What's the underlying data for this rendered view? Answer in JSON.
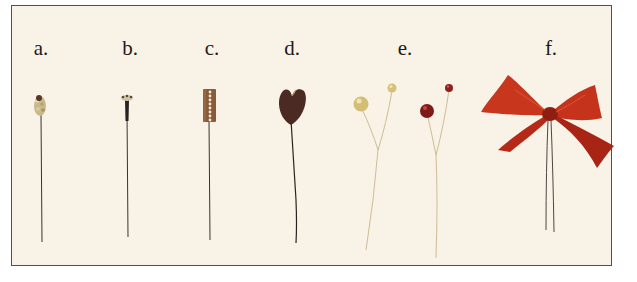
{
  "image": {
    "description": "Photo of six floral wire picks on a cream card, labeled a through f",
    "card_color": "#f8f2e7",
    "border_color": "#7a3f3a"
  },
  "labels": [
    {
      "id": "a",
      "text": "a.",
      "x": 41
    },
    {
      "id": "b",
      "text": "b.",
      "x": 130
    },
    {
      "id": "c",
      "text": "c.",
      "x": 212
    },
    {
      "id": "d",
      "text": "d.",
      "x": 292
    },
    {
      "id": "e",
      "text": "e.",
      "x": 405
    },
    {
      "id": "f",
      "text": "f.",
      "x": 551
    }
  ],
  "items": [
    {
      "id": "a",
      "name": "beaded-cluster-pick",
      "colors": [
        "#c9b88a",
        "#5a3a2a"
      ]
    },
    {
      "id": "b",
      "name": "dark-stamen-pick",
      "colors": [
        "#2a2220",
        "#cfc4a8"
      ]
    },
    {
      "id": "c",
      "name": "rectangular-bead-with-pearls-pick",
      "colors": [
        "#8a5a3a",
        "#efe6d0"
      ]
    },
    {
      "id": "d",
      "name": "heart-shaped-seed-pick",
      "colors": [
        "#4a2a22"
      ]
    },
    {
      "id": "e",
      "name": "gold-and-red-pearl-picks",
      "colors": [
        "#d8c27a",
        "#8a1c1c"
      ]
    },
    {
      "id": "f",
      "name": "red-ribbon-bow-pick",
      "colors": [
        "#c8301c",
        "#8e1e12"
      ]
    }
  ]
}
